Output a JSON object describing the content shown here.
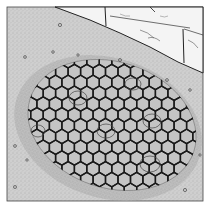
{
  "image": {
    "description": "Pen-and-ink illustration of a circular pit covered by a hexagonal wire mesh net, set in speckled sandy ground with a stone-block wall at top right",
    "subjects": [
      "hexagonal-mesh-net",
      "pit",
      "stone-wall",
      "speckled-ground",
      "pebbles"
    ],
    "colors": {
      "background": "#ffffff",
      "ground": "#cfcfcf",
      "ground_dark": "#9a9a9a",
      "pit": "#bdbdbd",
      "mesh": "#1a1a1a",
      "stone": "#f4f4f4",
      "outline": "#222222"
    }
  }
}
